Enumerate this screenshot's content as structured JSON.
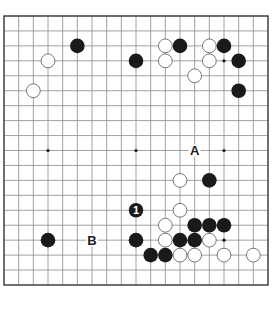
{
  "diagram": {
    "type": "go-board",
    "size": 19,
    "colors": {
      "background": "#ffffff",
      "grid_line": "#8a8a8a",
      "border": "#333333",
      "black_stone": "#1a1a1a",
      "white_stone_fill": "#ffffff",
      "white_stone_edge": "#555555",
      "star_point": "#111111",
      "label": "#222222"
    },
    "star_points": [
      {
        "col": 3,
        "row": 3
      },
      {
        "col": 9,
        "row": 3
      },
      {
        "col": 15,
        "row": 3
      },
      {
        "col": 3,
        "row": 9
      },
      {
        "col": 9,
        "row": 9
      },
      {
        "col": 15,
        "row": 9
      },
      {
        "col": 3,
        "row": 15
      },
      {
        "col": 9,
        "row": 15
      },
      {
        "col": 15,
        "row": 15
      }
    ],
    "stones": [
      {
        "color": "black",
        "col": 5,
        "row": 2
      },
      {
        "color": "white",
        "col": 3,
        "row": 3
      },
      {
        "color": "white",
        "col": 2,
        "row": 5
      },
      {
        "color": "black",
        "col": 9,
        "row": 3
      },
      {
        "color": "white",
        "col": 11,
        "row": 2
      },
      {
        "color": "black",
        "col": 12,
        "row": 2
      },
      {
        "color": "white",
        "col": 11,
        "row": 3
      },
      {
        "color": "white",
        "col": 14,
        "row": 2
      },
      {
        "color": "black",
        "col": 15,
        "row": 2
      },
      {
        "color": "white",
        "col": 14,
        "row": 3
      },
      {
        "color": "black",
        "col": 16,
        "row": 3
      },
      {
        "color": "white",
        "col": 13,
        "row": 4
      },
      {
        "color": "black",
        "col": 16,
        "row": 5
      },
      {
        "color": "white",
        "col": 12,
        "row": 11
      },
      {
        "color": "black",
        "col": 14,
        "row": 11
      },
      {
        "color": "black",
        "col": 9,
        "row": 13,
        "label": "1"
      },
      {
        "color": "white",
        "col": 12,
        "row": 13
      },
      {
        "color": "white",
        "col": 11,
        "row": 14
      },
      {
        "color": "black",
        "col": 13,
        "row": 14
      },
      {
        "color": "black",
        "col": 14,
        "row": 14
      },
      {
        "color": "black",
        "col": 15,
        "row": 14
      },
      {
        "color": "black",
        "col": 3,
        "row": 15
      },
      {
        "color": "black",
        "col": 9,
        "row": 15
      },
      {
        "color": "white",
        "col": 11,
        "row": 15
      },
      {
        "color": "black",
        "col": 12,
        "row": 15
      },
      {
        "color": "black",
        "col": 13,
        "row": 15
      },
      {
        "color": "white",
        "col": 14,
        "row": 15
      },
      {
        "color": "black",
        "col": 10,
        "row": 16
      },
      {
        "color": "black",
        "col": 11,
        "row": 16
      },
      {
        "color": "white",
        "col": 12,
        "row": 16
      },
      {
        "color": "white",
        "col": 13,
        "row": 16
      },
      {
        "color": "white",
        "col": 15,
        "row": 16
      },
      {
        "color": "white",
        "col": 17,
        "row": 16
      }
    ],
    "labels": [
      {
        "text": "A",
        "col": 13,
        "row": 9
      },
      {
        "text": "B",
        "col": 6,
        "row": 15
      }
    ]
  }
}
